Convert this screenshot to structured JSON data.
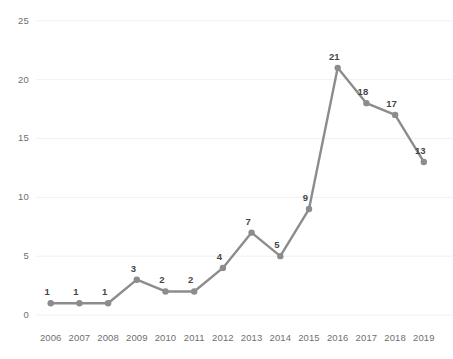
{
  "chart_data": {
    "type": "line",
    "title": "",
    "subtitle": "",
    "xlabel": "",
    "ylabel": "",
    "categories": [
      "2006",
      "2007",
      "2008",
      "2009",
      "2010",
      "2011",
      "2012",
      "2013",
      "2014",
      "2015",
      "2016",
      "2017",
      "2018",
      "2019"
    ],
    "values": [
      1,
      1,
      1,
      3,
      2,
      2,
      4,
      7,
      5,
      9,
      21,
      18,
      17,
      13
    ],
    "point_labels": [
      "1",
      "1",
      "1",
      "3",
      "2",
      "2",
      "4",
      "7",
      "5",
      "9",
      "21",
      "18",
      "17",
      "13"
    ],
    "ylim": [
      0,
      25
    ],
    "ytick_labels": [
      "0",
      "5",
      "10",
      "15",
      "20",
      "25"
    ],
    "ytick_values": [
      0,
      5,
      10,
      15,
      20,
      25
    ],
    "grid": true,
    "legend": false,
    "legend_position": "none",
    "series": [
      {
        "name": "",
        "values": [
          1,
          1,
          1,
          3,
          2,
          2,
          4,
          7,
          5,
          9,
          21,
          18,
          17,
          13
        ]
      }
    ],
    "colors": {
      "line": "#8c8c8c",
      "marker": "#8c8c8c",
      "grid": "#f2f2f2",
      "tick_text": "#6f6f6f",
      "label_text": "#464646",
      "background": "#ffffff"
    }
  }
}
